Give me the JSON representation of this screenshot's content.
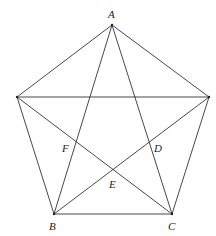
{
  "diagram": {
    "type": "pentagon-with-pentagram",
    "stroke_color": "#333333",
    "background": "#ffffff",
    "vertices": {
      "A": {
        "x": 112,
        "y": 25,
        "label": "A"
      },
      "L": {
        "x": 17,
        "y": 97,
        "label": ""
      },
      "R": {
        "x": 209,
        "y": 97,
        "label": ""
      },
      "B": {
        "x": 54,
        "y": 214,
        "label": "B"
      },
      "C": {
        "x": 172,
        "y": 214,
        "label": "C"
      }
    },
    "intersection_labels": {
      "F": {
        "label": "F",
        "x": 64,
        "y": 147
      },
      "D": {
        "label": "D",
        "x": 154,
        "y": 147
      },
      "E": {
        "label": "E",
        "x": 109,
        "y": 185
      }
    },
    "vertex_labels": {
      "A": "A",
      "B": "B",
      "C": "C"
    },
    "edges": [
      [
        "A",
        "L"
      ],
      [
        "A",
        "R"
      ],
      [
        "L",
        "B"
      ],
      [
        "R",
        "C"
      ],
      [
        "B",
        "C"
      ],
      [
        "A",
        "B"
      ],
      [
        "A",
        "C"
      ],
      [
        "L",
        "R"
      ],
      [
        "L",
        "C"
      ],
      [
        "R",
        "B"
      ]
    ]
  }
}
